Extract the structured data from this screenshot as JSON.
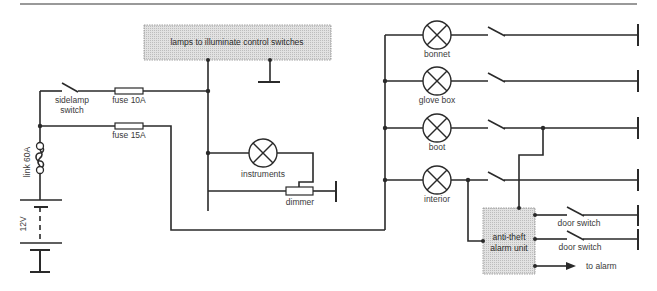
{
  "diagram": {
    "type": "circuit",
    "title_rule": true,
    "colors": {
      "wire": "#2a2a2a",
      "shaded_box": "#d9d9d9",
      "text": "#3a3a3a",
      "background": "#ffffff"
    },
    "supply": {
      "battery_label": "12V",
      "link_label": "link 60A"
    },
    "switches": {
      "sidelamp": "sidelamp",
      "sidelamp_line2": "switch"
    },
    "fuses": {
      "fuse_10a": "fuse 10A",
      "fuse_15a": "fuse 15A"
    },
    "boxes": {
      "control_lamps": "lamps to illuminate control switches",
      "alarm_line1": "anti-theft",
      "alarm_line2": "alarm unit"
    },
    "lamps": {
      "instruments": "instruments",
      "bonnet": "bonnet",
      "glove_box": "glove box",
      "boot": "boot",
      "interior": "interior"
    },
    "components": {
      "dimmer": "dimmer",
      "door_switch_1": "door switch",
      "door_switch_2": "door switch",
      "to_alarm": "to alarm"
    }
  }
}
